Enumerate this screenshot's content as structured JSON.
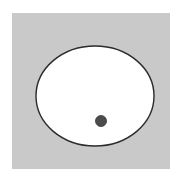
{
  "figure": {
    "title": "",
    "caption": "",
    "canvas": {
      "width": 190,
      "height": 181,
      "background_color": "#ffffff"
    },
    "panel": {
      "label": "background-panel",
      "x": 12,
      "y": 13,
      "width": 158,
      "height": 156,
      "fill_color": "#c9c9c9",
      "stroke_color": "none"
    },
    "ellipse": {
      "label": "white-ellipse",
      "center_x": 95,
      "center_y": 96,
      "radius_x": 59,
      "radius_y": 50,
      "fill_color": "#ffffff",
      "stroke_color": "#2b2b2b",
      "stroke_width": 1.4
    },
    "dot": {
      "label": "dark-dot",
      "center_x": 101,
      "center_y": 121,
      "radius": 5.5,
      "fill_color": "#4c4c4c",
      "stroke_color": "#333333",
      "stroke_width": 0.8
    }
  },
  "chart_data": {
    "type": "scatter",
    "title": "",
    "subtitle": "",
    "xlabel": "",
    "ylabel": "",
    "grid": false,
    "legend_position": "none",
    "axis_visible": false,
    "tick_labels_x": [],
    "tick_labels_y": [],
    "xlim": [
      0,
      190
    ],
    "ylim": [
      0,
      181
    ],
    "annotations": [
      {
        "name": "background-panel",
        "shape": "rectangle",
        "x": 12,
        "y": 13,
        "width": 158,
        "height": 156,
        "fill": "#c9c9c9"
      },
      {
        "name": "white-ellipse",
        "shape": "ellipse",
        "cx": 95,
        "cy": 96,
        "rx": 59,
        "ry": 50,
        "fill": "#ffffff",
        "stroke": "#2b2b2b"
      }
    ],
    "series": [
      {
        "name": "point",
        "marker": "circle",
        "color": "#4c4c4c",
        "size": 11,
        "x": [
          101
        ],
        "y": [
          121
        ]
      }
    ]
  }
}
